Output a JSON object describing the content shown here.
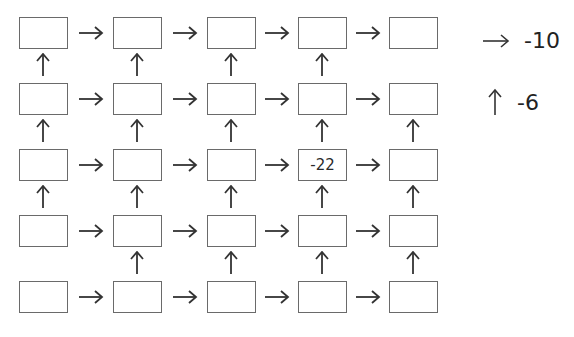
{
  "puzzle": {
    "rows": 5,
    "cols": 5,
    "cells": [
      [
        "",
        "",
        "",
        "",
        ""
      ],
      [
        "",
        "",
        "",
        "",
        ""
      ],
      [
        "",
        "",
        "",
        "-22",
        ""
      ],
      [
        "",
        "",
        "",
        "",
        ""
      ],
      [
        "",
        "",
        "",
        "",
        ""
      ]
    ],
    "vertical_arrows_below_row": [
      [
        true,
        true,
        true,
        true,
        false
      ],
      [
        true,
        true,
        true,
        true,
        true
      ],
      [
        true,
        true,
        true,
        true,
        true
      ],
      [
        false,
        true,
        true,
        true,
        true
      ]
    ]
  },
  "legend": {
    "right_arrow": {
      "icon": "right-arrow-icon",
      "value": "-10"
    },
    "up_arrow": {
      "icon": "up-arrow-icon",
      "value": "-6"
    }
  }
}
